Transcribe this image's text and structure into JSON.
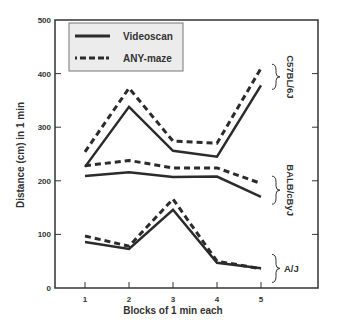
{
  "chart_data": {
    "type": "line",
    "title": "",
    "xlabel": "Blocks of 1 min each",
    "ylabel": "Distance (cm) in 1 min",
    "x": [
      1,
      2,
      3,
      4,
      5
    ],
    "xticks": [
      "1",
      "2",
      "3",
      "4",
      "5"
    ],
    "yticks": [
      "0",
      "100",
      "200",
      "300",
      "400",
      "500"
    ],
    "ylim": [
      0,
      500
    ],
    "grid": false,
    "legend": {
      "position": "upper-left",
      "entries": [
        {
          "label": "Videoscan",
          "style": "solid"
        },
        {
          "label": "ANY-maze",
          "style": "dashed"
        }
      ]
    },
    "groups": [
      {
        "label": "C57BL/6J",
        "series": [
          {
            "name": "Videoscan",
            "values": [
              226,
              338,
              256,
              245,
              378
            ]
          },
          {
            "name": "ANY-maze",
            "values": [
              254,
              373,
              274,
              270,
              410
            ]
          }
        ]
      },
      {
        "label": "BALB/cByJ",
        "series": [
          {
            "name": "Videoscan",
            "values": [
              209,
              216,
              207,
              208,
              170
            ]
          },
          {
            "name": "ANY-maze",
            "values": [
              228,
              238,
              224,
              224,
              195
            ]
          }
        ]
      },
      {
        "label": "A/J",
        "series": [
          {
            "name": "Videoscan",
            "values": [
              86,
              73,
              146,
              47,
              37
            ]
          },
          {
            "name": "ANY-maze",
            "values": [
              97,
              78,
              166,
              50,
              36
            ]
          }
        ]
      }
    ]
  },
  "colors": {
    "line": "#2b2b2b",
    "axis": "#333333",
    "legend_bg": "#ececec",
    "legend_border": "#777777"
  }
}
